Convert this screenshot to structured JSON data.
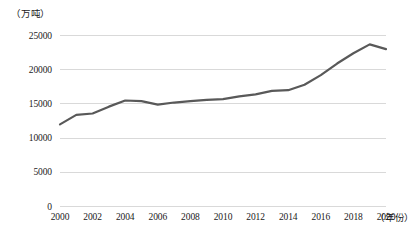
{
  "chart_data": {
    "type": "line",
    "title": "",
    "xlabel": "（年份）",
    "ylabel": "（万吨）",
    "x": [
      2000,
      2001,
      2002,
      2003,
      2004,
      2005,
      2006,
      2007,
      2008,
      2009,
      2010,
      2011,
      2012,
      2013,
      2014,
      2015,
      2016,
      2017,
      2018,
      2019,
      2020
    ],
    "values": [
      12000,
      13400,
      13600,
      14600,
      15500,
      15400,
      14900,
      15200,
      15400,
      15600,
      15700,
      16100,
      16400,
      16900,
      17000,
      17800,
      19200,
      20900,
      22400,
      23700,
      23000
    ],
    "x_tick_labels": [
      "2000",
      "2002",
      "2004",
      "2006",
      "2008",
      "2010",
      "2012",
      "2014",
      "2016",
      "2018",
      "2020"
    ],
    "x_tick_values": [
      2000,
      2002,
      2004,
      2006,
      2008,
      2010,
      2012,
      2014,
      2016,
      2018,
      2020
    ],
    "y_tick_labels": [
      "0",
      "5000",
      "10000",
      "15000",
      "20000",
      "25000"
    ],
    "y_tick_values": [
      0,
      5000,
      10000,
      15000,
      20000,
      25000
    ],
    "xlim": [
      2000,
      2020
    ],
    "ylim": [
      0,
      25000
    ],
    "grid": "horizontal",
    "legend": "none",
    "line_color": "#595959",
    "grid_color": "#d9d9d9",
    "background_color": "#ffffff"
  }
}
